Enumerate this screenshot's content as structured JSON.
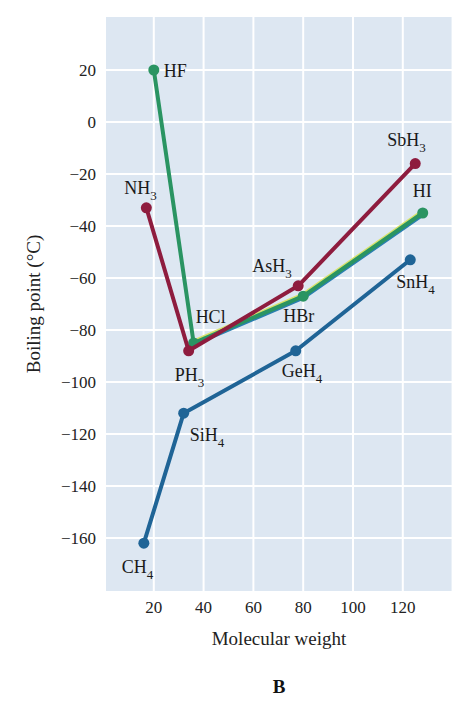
{
  "chart_data": {
    "type": "line",
    "title": "",
    "caption": "B",
    "xlabel": "Molecular weight",
    "ylabel": "Boiling point (°C)",
    "xlim": [
      1,
      140
    ],
    "ylim": [
      -180,
      40
    ],
    "xticks": [
      20,
      40,
      60,
      80,
      100,
      120
    ],
    "yticks": [
      20,
      0,
      -20,
      -40,
      -60,
      -80,
      -100,
      -120,
      -140,
      -160
    ],
    "grid": true,
    "legend": "none (points labeled directly)",
    "plot_background": "#dde7f2",
    "series": [
      {
        "name": "Group 14 hydrides",
        "color": "#1f6496",
        "points": [
          {
            "label": "CH4",
            "base": "CH",
            "sub": "4",
            "x": 16,
            "y": -162,
            "lx": -22,
            "ly": 30
          },
          {
            "label": "SiH4",
            "base": "SiH",
            "sub": "4",
            "x": 32,
            "y": -112,
            "lx": 6,
            "ly": 28
          },
          {
            "label": "GeH4",
            "base": "GeH",
            "sub": "4",
            "x": 77,
            "y": -88,
            "lx": -14,
            "ly": 26
          },
          {
            "label": "SnH4",
            "base": "SnH",
            "sub": "4",
            "x": 123,
            "y": -53,
            "lx": -14,
            "ly": 28
          }
        ]
      },
      {
        "name": "Group 17 hydrides",
        "color": "#2a9462",
        "highlight": "#d8e36a",
        "points": [
          {
            "label": "HF",
            "base": "HF",
            "sub": "",
            "x": 20,
            "y": 20,
            "lx": 10,
            "ly": 7
          },
          {
            "label": "HCl",
            "base": "HCl",
            "sub": "",
            "x": 36,
            "y": -85,
            "lx": 2,
            "ly": -20
          },
          {
            "label": "HBr",
            "base": "HBr",
            "sub": "",
            "x": 80,
            "y": -67,
            "lx": -20,
            "ly": 26
          },
          {
            "label": "HI",
            "base": "HI",
            "sub": "",
            "x": 128,
            "y": -35,
            "lx": -10,
            "ly": -16
          }
        ]
      },
      {
        "name": "Group 15 hydrides",
        "color": "#8e1c3e",
        "points": [
          {
            "label": "NH3",
            "base": "NH",
            "sub": "3",
            "x": 17,
            "y": -33,
            "lx": -22,
            "ly": -14
          },
          {
            "label": "PH3",
            "base": "PH",
            "sub": "3",
            "x": 34,
            "y": -88,
            "lx": -14,
            "ly": 30
          },
          {
            "label": "AsH3",
            "base": "AsH",
            "sub": "3",
            "x": 78,
            "y": -63,
            "lx": -46,
            "ly": -14
          },
          {
            "label": "SbH3",
            "base": "SbH",
            "sub": "3",
            "x": 125,
            "y": -16,
            "lx": -28,
            "ly": -18
          }
        ]
      }
    ]
  }
}
